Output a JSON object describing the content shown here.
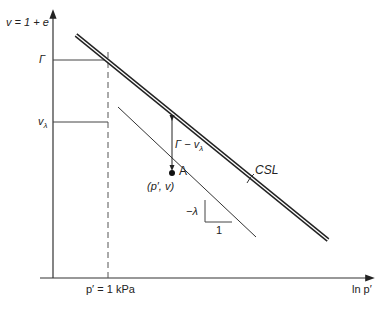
{
  "diagram": {
    "y_axis_label": "v = 1 + e",
    "x_axis_label": "ln p′",
    "x_reference_label": "p′ = 1 kPa",
    "gamma_label": "Γ",
    "v_lambda_label": "v",
    "v_lambda_sub": "λ",
    "csl_label": "CSL",
    "gap_label": "Γ − v",
    "gap_label_sub": "λ",
    "point_label": "A",
    "point_coords_label": "(p′, v)",
    "slope_label": "−λ",
    "slope_run_label": "1",
    "colors": {
      "line": "#2a2a2a",
      "axis": "#333333",
      "background": "#ffffff"
    }
  }
}
